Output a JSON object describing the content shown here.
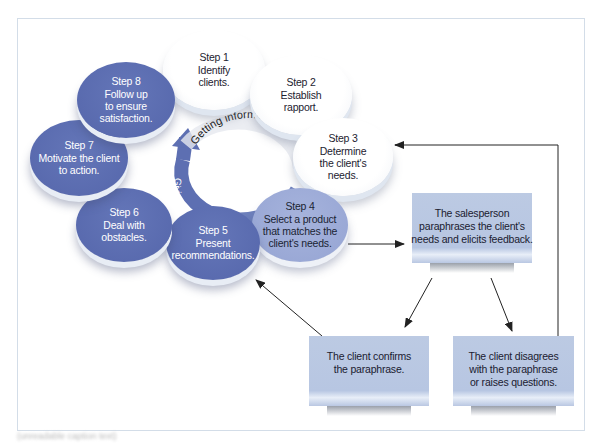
{
  "diagram": {
    "steps": [
      {
        "id": 1,
        "title": "Step 1",
        "lines": [
          "Identify",
          "clients."
        ],
        "style": "white"
      },
      {
        "id": 2,
        "title": "Step 2",
        "lines": [
          "Establish",
          "rapport."
        ],
        "style": "white"
      },
      {
        "id": 3,
        "title": "Step 3",
        "lines": [
          "Determine",
          "the client's",
          "needs."
        ],
        "style": "white"
      },
      {
        "id": 4,
        "title": "Step 4",
        "lines": [
          "Select a product",
          "that matches the",
          "client's needs."
        ],
        "style": "light"
      },
      {
        "id": 5,
        "title": "Step 5",
        "lines": [
          "Present",
          "recommendations."
        ],
        "style": "dark"
      },
      {
        "id": 6,
        "title": "Step 6",
        "lines": [
          "Deal with",
          "obstacles."
        ],
        "style": "dark"
      },
      {
        "id": 7,
        "title": "Step 7",
        "lines": [
          "Motivate the client",
          "to action."
        ],
        "style": "dark"
      },
      {
        "id": 8,
        "title": "Step 8",
        "lines": [
          "Follow up",
          "to ensure",
          "satisfaction."
        ],
        "style": "dark"
      }
    ],
    "center": {
      "getting_label": "Getting information",
      "giving_label": "Giving information"
    },
    "boxes": {
      "paraphrase": {
        "lines": [
          "The salesperson",
          "paraphrases the client's",
          "needs and elicits feedback."
        ]
      },
      "confirms": {
        "lines": [
          "The client confirms",
          "the paraphrase."
        ]
      },
      "disagrees": {
        "lines": [
          "The client disagrees",
          "with the paraphrase",
          "or raises questions."
        ]
      }
    },
    "flows": [
      {
        "from": "Step 4",
        "to": "paraphrase"
      },
      {
        "from": "paraphrase",
        "to": "confirms"
      },
      {
        "from": "paraphrase",
        "to": "disagrees"
      },
      {
        "from": "confirms",
        "to": "Step 5"
      },
      {
        "from": "disagrees",
        "to": "Step 3"
      }
    ],
    "colors": {
      "dark_step": "#5566ab",
      "light_step": "#99a7d5",
      "white_step": "#ffffff",
      "box_fill": "#bac8e3",
      "arrow": "#333333",
      "frame_border": "#d3dde8"
    },
    "caption": "(unreadable caption text)"
  }
}
